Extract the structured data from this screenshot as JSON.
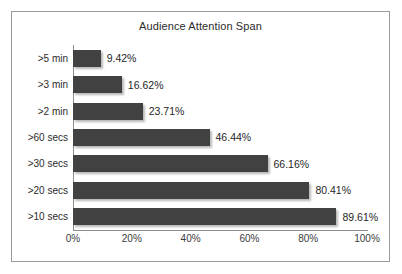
{
  "chart_data": {
    "type": "bar",
    "orientation": "horizontal",
    "title": "Audience Attention Span",
    "xlabel": "",
    "ylabel": "",
    "categories": [
      ">5 min",
      ">3 min",
      ">2 min",
      ">60 secs",
      ">30 secs",
      ">20 secs",
      ">10 secs"
    ],
    "values": [
      9.42,
      16.62,
      23.71,
      46.44,
      66.16,
      80.41,
      89.61
    ],
    "value_labels": [
      "9.42%",
      "16.62%",
      "23.71%",
      "46.44%",
      "66.16%",
      "80.41%",
      "89.61%"
    ],
    "xlim": [
      0,
      100
    ],
    "xticks": [
      0,
      20,
      40,
      60,
      80,
      100
    ],
    "xtick_labels": [
      "0%",
      "20%",
      "40%",
      "60%",
      "80%",
      "100%"
    ],
    "grid": false,
    "legend": false,
    "bar_color": "#414141",
    "frame_color": "#9a9a9a",
    "axis_color": "#8d8d8d",
    "background": "#ffffff"
  }
}
